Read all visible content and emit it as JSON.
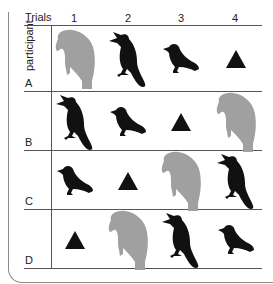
{
  "header": {
    "trials_label": "Trials",
    "columns": [
      "1",
      "2",
      "3",
      "4"
    ]
  },
  "row_axis_label": "participant",
  "rows": [
    {
      "label": "A",
      "sequence": [
        "parrot",
        "cardinal",
        "finch",
        "triangle"
      ]
    },
    {
      "label": "B",
      "sequence": [
        "cardinal",
        "finch",
        "triangle",
        "parrot"
      ]
    },
    {
      "label": "C",
      "sequence": [
        "finch",
        "triangle",
        "parrot",
        "cardinal"
      ]
    },
    {
      "label": "D",
      "sequence": [
        "triangle",
        "parrot",
        "cardinal",
        "finch"
      ]
    }
  ],
  "stimulus_colors": {
    "parrot": "#a0a0a0",
    "cardinal": "#111111",
    "finch": "#111111",
    "triangle": "#111111"
  },
  "icons": {
    "parrot": "parrot-silhouette-icon",
    "cardinal": "cardinal-silhouette-icon",
    "finch": "finch-silhouette-icon",
    "triangle": "triangle-icon"
  }
}
